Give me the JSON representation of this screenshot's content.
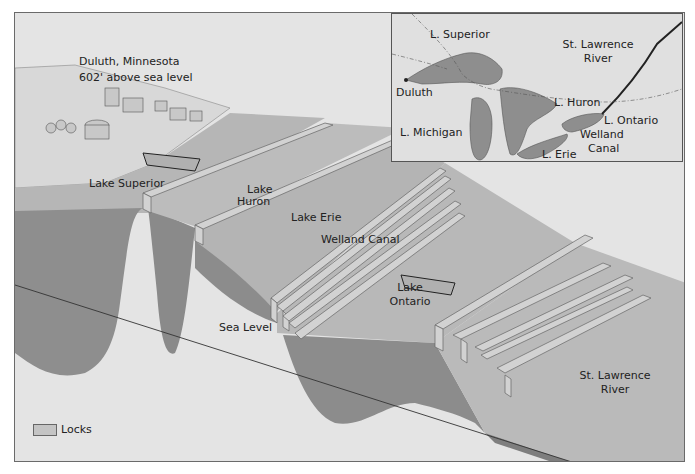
{
  "diagram": {
    "type": "cross-section illustration",
    "colors": {
      "background": "#e6e6e6",
      "water_surface": "#b8b8b8",
      "water_depth": "#8c8c8c",
      "lock_wall": "#d0d0d0",
      "ground": "#dcdcdc",
      "frame_border": "#6a6a6a"
    }
  },
  "labels": {
    "origin_city": "Duluth, Minnesota",
    "origin_elevation": "602' above sea level",
    "lake_superior": "Lake Superior",
    "lake_huron_line1": "Lake",
    "lake_huron_line2": "Huron",
    "lake_erie": "Lake Erie",
    "welland_canal": "Welland Canal",
    "lake_ontario_line1": "Lake",
    "lake_ontario_line2": "Ontario",
    "sea_level": "Sea Level",
    "st_lawrence_line1": "St. Lawrence",
    "st_lawrence_line2": "River"
  },
  "inset_map": {
    "labels": {
      "superior": "L. Superior",
      "duluth": "Duluth",
      "michigan": "L. Michigan",
      "huron": "L. Huron",
      "ontario": "L. Ontario",
      "erie": "L. Erie",
      "welland_line1": "Welland",
      "welland_line2": "Canal",
      "st_lawrence_line1": "St. Lawrence",
      "st_lawrence_line2": "River"
    }
  },
  "legend": {
    "items": [
      {
        "label": "Locks",
        "swatch_color": "#c4c4c4"
      }
    ]
  }
}
